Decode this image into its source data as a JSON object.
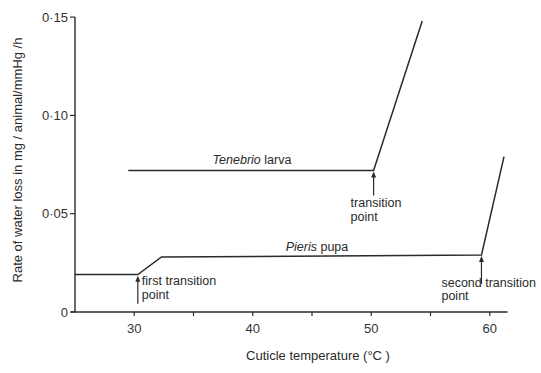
{
  "chart_data": {
    "type": "line",
    "title": "",
    "xlabel": "Cuticle temperature (°C )",
    "ylabel": "Rate of water loss in mg / animal/mmHg /h",
    "xlim": [
      25,
      61.5
    ],
    "ylim": [
      0,
      0.15
    ],
    "x_ticks": [
      30,
      35,
      40,
      45,
      50,
      55,
      60
    ],
    "x_tick_labels": [
      "30",
      "",
      "40",
      "",
      "50",
      "",
      "60"
    ],
    "y_ticks": [
      0,
      0.05,
      0.1,
      0.15
    ],
    "y_tick_labels": [
      "0",
      "0·05",
      "0·10",
      "0·15"
    ],
    "grid": false,
    "legend": "none (inline labels)",
    "series": [
      {
        "name": "Tenebrio larva",
        "name_italic_part": "Tenebrio",
        "name_plain_part": " larva",
        "x": [
          29.5,
          50.2,
          54.3
        ],
        "y": [
          0.072,
          0.072,
          0.148
        ]
      },
      {
        "name": "Pieris pupa",
        "name_italic_part": "Pieris",
        "name_plain_part": " pupa",
        "x": [
          25.0,
          30.3,
          32.3,
          59.3,
          61.2
        ],
        "y": [
          0.019,
          0.019,
          0.028,
          0.029,
          0.079
        ]
      }
    ],
    "annotations": [
      {
        "text_line1": "transition",
        "text_line2": "point",
        "x": 50.2,
        "y": 0.072,
        "series": "Tenebrio larva"
      },
      {
        "text_line1": "first transition",
        "text_line2": "point",
        "x": 30.3,
        "y": 0.019,
        "series": "Pieris pupa"
      },
      {
        "text_line1": "second transition",
        "text_line2": "point",
        "x": 59.3,
        "y": 0.029,
        "series": "Pieris pupa"
      }
    ]
  },
  "colors": {
    "line": "#2a2a2a",
    "background": "#ffffff"
  }
}
